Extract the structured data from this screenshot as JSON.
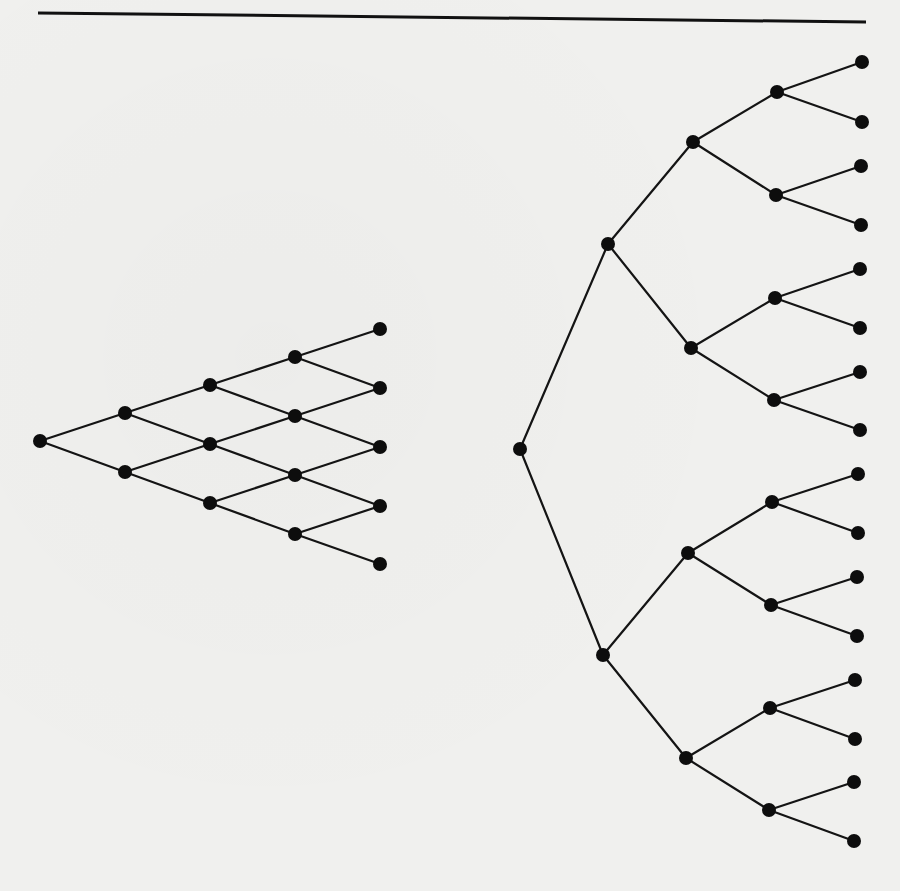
{
  "page": {
    "background": "#f0f0ee",
    "ink": "#111111",
    "top_rule": {
      "x1": 38,
      "y1": 13,
      "x2": 866,
      "y2": 22
    }
  },
  "diagrams": [
    {
      "id": "recombining-lattice",
      "type": "binomial-lattice",
      "steps": 4,
      "node_radius": 7,
      "nodes": [
        {
          "id": "L0_0",
          "x": 40,
          "y": 441
        },
        {
          "id": "L1_0",
          "x": 125,
          "y": 413
        },
        {
          "id": "L1_1",
          "x": 125,
          "y": 472
        },
        {
          "id": "L2_0",
          "x": 210,
          "y": 385
        },
        {
          "id": "L2_1",
          "x": 210,
          "y": 444
        },
        {
          "id": "L2_2",
          "x": 210,
          "y": 503
        },
        {
          "id": "L3_0",
          "x": 295,
          "y": 357
        },
        {
          "id": "L3_1",
          "x": 295,
          "y": 416
        },
        {
          "id": "L3_2",
          "x": 295,
          "y": 475
        },
        {
          "id": "L3_3",
          "x": 295,
          "y": 534
        },
        {
          "id": "L4_0",
          "x": 380,
          "y": 329
        },
        {
          "id": "L4_1",
          "x": 380,
          "y": 388
        },
        {
          "id": "L4_2",
          "x": 380,
          "y": 447
        },
        {
          "id": "L4_3",
          "x": 380,
          "y": 506
        },
        {
          "id": "L4_4",
          "x": 380,
          "y": 564
        }
      ],
      "edges": [
        [
          "L0_0",
          "L1_0"
        ],
        [
          "L0_0",
          "L1_1"
        ],
        [
          "L1_0",
          "L2_0"
        ],
        [
          "L1_0",
          "L2_1"
        ],
        [
          "L1_1",
          "L2_1"
        ],
        [
          "L1_1",
          "L2_2"
        ],
        [
          "L2_0",
          "L3_0"
        ],
        [
          "L2_0",
          "L3_1"
        ],
        [
          "L2_1",
          "L3_1"
        ],
        [
          "L2_1",
          "L3_2"
        ],
        [
          "L2_2",
          "L3_2"
        ],
        [
          "L2_2",
          "L3_3"
        ],
        [
          "L3_0",
          "L4_0"
        ],
        [
          "L3_0",
          "L4_1"
        ],
        [
          "L3_1",
          "L4_1"
        ],
        [
          "L3_1",
          "L4_2"
        ],
        [
          "L3_2",
          "L4_2"
        ],
        [
          "L3_2",
          "L4_3"
        ],
        [
          "L3_3",
          "L4_3"
        ],
        [
          "L3_3",
          "L4_4"
        ]
      ]
    },
    {
      "id": "binary-tree",
      "type": "non-recombining-binary-tree",
      "depth": 4,
      "leaf_count": 16,
      "node_radius": 7,
      "nodes": [
        {
          "id": "T0",
          "x": 520,
          "y": 449
        },
        {
          "id": "T1a",
          "x": 608,
          "y": 244
        },
        {
          "id": "T1b",
          "x": 603,
          "y": 655
        },
        {
          "id": "T2a",
          "x": 693,
          "y": 142
        },
        {
          "id": "T2b",
          "x": 691,
          "y": 348
        },
        {
          "id": "T2c",
          "x": 688,
          "y": 553
        },
        {
          "id": "T2d",
          "x": 686,
          "y": 758
        },
        {
          "id": "T3a",
          "x": 777,
          "y": 92
        },
        {
          "id": "T3b",
          "x": 776,
          "y": 195
        },
        {
          "id": "T3c",
          "x": 775,
          "y": 298
        },
        {
          "id": "T3d",
          "x": 774,
          "y": 400
        },
        {
          "id": "T3e",
          "x": 772,
          "y": 502
        },
        {
          "id": "T3f",
          "x": 771,
          "y": 605
        },
        {
          "id": "T3g",
          "x": 770,
          "y": 708
        },
        {
          "id": "T3h",
          "x": 769,
          "y": 810
        },
        {
          "id": "T4_01",
          "x": 862,
          "y": 62
        },
        {
          "id": "T4_02",
          "x": 862,
          "y": 122
        },
        {
          "id": "T4_03",
          "x": 861,
          "y": 166
        },
        {
          "id": "T4_04",
          "x": 861,
          "y": 225
        },
        {
          "id": "T4_05",
          "x": 860,
          "y": 269
        },
        {
          "id": "T4_06",
          "x": 860,
          "y": 328
        },
        {
          "id": "T4_07",
          "x": 860,
          "y": 372
        },
        {
          "id": "T4_08",
          "x": 860,
          "y": 430
        },
        {
          "id": "T4_09",
          "x": 858,
          "y": 474
        },
        {
          "id": "T4_10",
          "x": 858,
          "y": 533
        },
        {
          "id": "T4_11",
          "x": 857,
          "y": 577
        },
        {
          "id": "T4_12",
          "x": 857,
          "y": 636
        },
        {
          "id": "T4_13",
          "x": 855,
          "y": 680
        },
        {
          "id": "T4_14",
          "x": 855,
          "y": 739
        },
        {
          "id": "T4_15",
          "x": 854,
          "y": 782
        },
        {
          "id": "T4_16",
          "x": 854,
          "y": 841
        }
      ],
      "edges": [
        [
          "T0",
          "T1a"
        ],
        [
          "T0",
          "T1b"
        ],
        [
          "T1a",
          "T2a"
        ],
        [
          "T1a",
          "T2b"
        ],
        [
          "T1b",
          "T2c"
        ],
        [
          "T1b",
          "T2d"
        ],
        [
          "T2a",
          "T3a"
        ],
        [
          "T2a",
          "T3b"
        ],
        [
          "T2b",
          "T3c"
        ],
        [
          "T2b",
          "T3d"
        ],
        [
          "T2c",
          "T3e"
        ],
        [
          "T2c",
          "T3f"
        ],
        [
          "T2d",
          "T3g"
        ],
        [
          "T2d",
          "T3h"
        ],
        [
          "T3a",
          "T4_01"
        ],
        [
          "T3a",
          "T4_02"
        ],
        [
          "T3b",
          "T4_03"
        ],
        [
          "T3b",
          "T4_04"
        ],
        [
          "T3c",
          "T4_05"
        ],
        [
          "T3c",
          "T4_06"
        ],
        [
          "T3d",
          "T4_07"
        ],
        [
          "T3d",
          "T4_08"
        ],
        [
          "T3e",
          "T4_09"
        ],
        [
          "T3e",
          "T4_10"
        ],
        [
          "T3f",
          "T4_11"
        ],
        [
          "T3f",
          "T4_12"
        ],
        [
          "T3g",
          "T4_13"
        ],
        [
          "T3g",
          "T4_14"
        ],
        [
          "T3h",
          "T4_15"
        ],
        [
          "T3h",
          "T4_16"
        ]
      ]
    }
  ]
}
